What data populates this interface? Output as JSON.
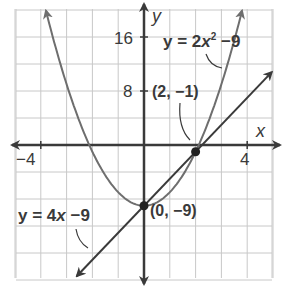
{
  "chart_data": {
    "type": "line",
    "title": "",
    "xlabel": "x",
    "ylabel": "y",
    "xlim": [
      -5,
      5
    ],
    "ylim": [
      -20,
      20
    ],
    "grid": true,
    "grid_step": {
      "x": 1,
      "y": 4
    },
    "x_tick_labels": [
      {
        "value": -4,
        "label": "−4"
      },
      {
        "value": 4,
        "label": "4"
      }
    ],
    "y_tick_labels": [
      {
        "value": 8,
        "label": "8"
      },
      {
        "value": 16,
        "label": "16"
      }
    ],
    "series": [
      {
        "name": "y = 2x² − 9",
        "kind": "parabola",
        "equation": "y = 2x^2 - 9",
        "x_range": [
          -3.8,
          3.8
        ],
        "color": "#6e6e6e",
        "points": [
          [
            -3.8,
            19.88
          ],
          [
            -3,
            9
          ],
          [
            -2,
            -1
          ],
          [
            -1,
            -7
          ],
          [
            0,
            -9
          ],
          [
            1,
            -7
          ],
          [
            2,
            -1
          ],
          [
            3,
            9
          ],
          [
            3.8,
            19.88
          ]
        ]
      },
      {
        "name": "y = 4x − 9",
        "kind": "line",
        "equation": "y = 4x - 9",
        "x_range": [
          -2.6,
          4.95
        ],
        "color": "#3a3a3a",
        "points": [
          [
            -2.6,
            -19.4
          ],
          [
            0,
            -9
          ],
          [
            2,
            -1
          ],
          [
            4.95,
            10.8
          ]
        ]
      }
    ],
    "highlighted_points": [
      {
        "x": 2,
        "y": -1,
        "label": "(2, −1)"
      },
      {
        "x": 0,
        "y": -9,
        "label": "(0, −9)"
      }
    ],
    "annotations": [
      {
        "text": "y = 2x² − 9",
        "points_to": "parabola"
      },
      {
        "text": "y = 4x − 9",
        "points_to": "line"
      },
      {
        "text": "(2, −1)",
        "points_to": "intersection"
      },
      {
        "text": "(0, −9)",
        "points_to": "intersection"
      }
    ]
  },
  "labels": {
    "x_axis": "x",
    "y_axis": "y",
    "tick_neg4": "−4",
    "tick_4": "4",
    "tick_8": "8",
    "tick_16": "16",
    "parabola_eq_prefix": "y = 2",
    "parabola_eq_var": "x",
    "parabola_eq_exp": "2",
    "parabola_eq_suffix": " −9",
    "line_eq_prefix": "y = 4",
    "line_eq_var": "x",
    "line_eq_suffix": " −9",
    "point_a": "(2, −1)",
    "point_b": "(0, −9)"
  },
  "colors": {
    "grid": "#c8c8c8",
    "axis": "#3a3a3a",
    "parabola": "#6e6e6e",
    "line": "#3a3a3a",
    "text": "#3a3a3a"
  }
}
